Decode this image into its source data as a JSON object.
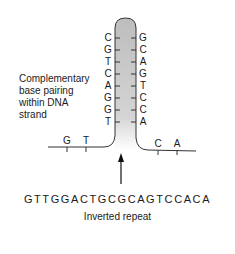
{
  "diagram": {
    "label": "Complementary base pairing within DNA strand",
    "label_lines": [
      "Complementary",
      "base pairing",
      "within DNA",
      "strand"
    ],
    "stem_left": [
      "C",
      "G",
      "T",
      "C",
      "A",
      "G",
      "G",
      "T"
    ],
    "stem_right": [
      "G",
      "C",
      "A",
      "G",
      "T",
      "C",
      "C",
      "A"
    ],
    "flank_left": [
      "G",
      "T"
    ],
    "flank_right": [
      "C",
      "A"
    ],
    "sequence": "GTTGGACTGCGCAGTCCACA",
    "caption": "Inverted repeat",
    "colors": {
      "stem_fill": "#c8c8c8",
      "line": "#333333"
    }
  }
}
